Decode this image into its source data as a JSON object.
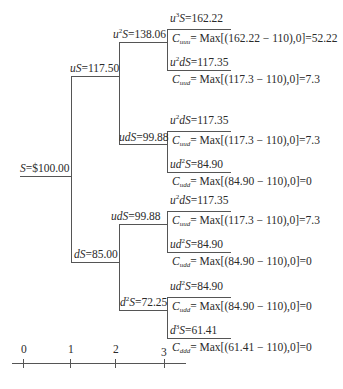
{
  "strike": 110,
  "nodes": {
    "s0": {
      "label": "S=$100.00"
    },
    "u": {
      "label": "uS=117.50"
    },
    "d": {
      "label": "dS=85.00"
    },
    "uu": {
      "label": "u²S=138.06"
    },
    "ud_top": {
      "label": "udS=99.88"
    },
    "ud_bottom": {
      "label": "udS=99.88"
    },
    "dd": {
      "label": "d²S=72.25"
    }
  },
  "terminal": [
    {
      "price": "u³S=162.22",
      "payoff": "Cuuu = Max[(162.22 − 110),0]=52.22",
      "sub": "uuu",
      "expr": "= Max[(162.22 − 110),0]=52.22",
      "pre": "u",
      "sup": "3",
      "post": "S=162.22"
    },
    {
      "price": "u²dS=117.35",
      "payoff": "Cuud = Max[(117.3 − 110),0]=7.3",
      "sub": "uud",
      "expr": "= Max[(117.3 − 110),0]=7.3",
      "pre": "u",
      "sup": "2",
      "post": "dS=117.35"
    },
    {
      "price": "u²dS=117.35",
      "payoff": "Cuud = Max[(117.3 − 110),0]=7.3",
      "sub": "uud",
      "expr": "= Max[(117.3 − 110),0]=7.3",
      "pre": "u",
      "sup": "2",
      "post": "dS=117.35"
    },
    {
      "price": "ud²S=84.90",
      "payoff": "Cudd = Max[(84.90 − 110),0]=0",
      "sub": "udd",
      "expr": "= Max[(84.90 − 110),0]=0",
      "pre": "ud",
      "sup": "2",
      "post": "S=84.90"
    },
    {
      "price": "u²dS=117.35",
      "payoff": "Cuud = Max[(117.3 − 110),0]=7.3",
      "sub": "uud",
      "expr": "= Max[(117.3 − 110),0]=7.3",
      "pre": "u",
      "sup": "2",
      "post": "dS=117.35"
    },
    {
      "price": "ud²S=84.90",
      "payoff": "Cudd = Max[(84.90 − 110),0]=0",
      "sub": "udd",
      "expr": "= Max[(84.90 − 110),0]=0",
      "pre": "ud",
      "sup": "2",
      "post": "S=84.90"
    },
    {
      "price": "ud²S=84.90",
      "payoff": "Cudd = Max[(84.90 − 110),0]=0",
      "sub": "udd",
      "expr": "= Max[(84.90 − 110),0]=0",
      "pre": "ud",
      "sup": "2",
      "post": "S=84.90"
    },
    {
      "price": "d³S=61.41",
      "payoff": "Cddd = Max[(61.41 − 110),0]=0",
      "sub": "ddd",
      "expr": "= Max[(61.41 − 110),0]=0",
      "pre": "d",
      "sup": "3",
      "post": "S=61.41"
    }
  ],
  "timeline": {
    "ticks": [
      "0",
      "1",
      "2",
      "3"
    ]
  },
  "colors": {
    "line": "#555555",
    "text": "#2a2a2a",
    "background": "#ffffff"
  }
}
